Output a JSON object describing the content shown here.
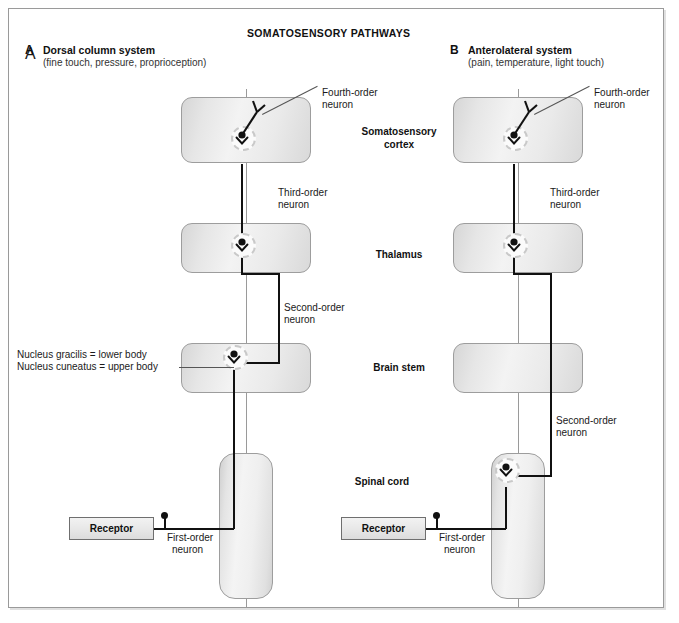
{
  "figure": {
    "title": "SOMATOSENSORY PATHWAYS",
    "caption": ""
  },
  "panels": [
    {
      "letter": "A",
      "title": "Dorsal column system",
      "subtitle": "(fine touch, pressure, proprioception)",
      "callouts": {
        "fourth_order": "Fourth-order\nneuron",
        "fourth_order_line1": "Fourth-order",
        "fourth_order_line2": "neuron",
        "third_order_line1": "Third-order",
        "third_order_line2": "neuron",
        "second_order_line1": "Second-order",
        "second_order_line2": "neuron",
        "first_order_line1": "First-order",
        "first_order_line2": "neuron"
      },
      "receptor_label": "Receptor"
    },
    {
      "letter": "B",
      "title": "Anterolateral system",
      "subtitle": "(pain, temperature, light touch)",
      "callouts": {
        "fourth_order_line1": "Fourth-order",
        "fourth_order_line2": "neuron",
        "third_order_line1": "Third-order",
        "third_order_line2": "neuron",
        "second_order_line1": "Second-order",
        "second_order_line2": "neuron",
        "first_order_line1": "First-order",
        "first_order_line2": "neuron"
      },
      "receptor_label": "Receptor"
    }
  ],
  "structures": {
    "somatosensory_cortex_line1": "Somatosensory",
    "somatosensory_cortex_line2": "cortex",
    "thalamus": "Thalamus",
    "brain_stem": "Brain stem",
    "spinal_cord": "Spinal cord"
  },
  "annotations": {
    "nucleus_gracilis": "Nucleus gracilis = lower body",
    "nucleus_cuneatus": "Nucleus cuneatus = upper body"
  },
  "colors": {
    "frame_border": "#9a9a9a",
    "block_border": "#9d9d9d",
    "tract": "#111111",
    "midline": "#9a9a9a",
    "text": "#1a1a1a"
  }
}
